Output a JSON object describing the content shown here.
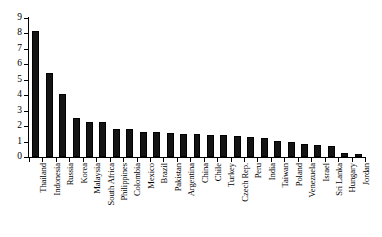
{
  "chart_data": {
    "type": "bar",
    "title": "",
    "subtitle": "",
    "xlabel": "",
    "ylabel": "",
    "ylim": [
      0,
      9
    ],
    "ytick_labels": [
      "0",
      "1",
      "2",
      "3",
      "4",
      "5",
      "6",
      "7",
      "8",
      "9"
    ],
    "ytick_values": [
      0,
      1,
      2,
      3,
      4,
      5,
      6,
      7,
      8,
      9
    ],
    "grid": false,
    "legend": null,
    "bar_color": "#141414",
    "axis_color": "#000000",
    "background_color": "#ffffff",
    "categories": [
      "Thailand",
      "Indonesia",
      "Russia",
      "Korea",
      "Malaysia",
      "South Africa",
      "Philippines",
      "Colombia",
      "Mexico",
      "Brazil",
      "Pakistan",
      "Argentina",
      "China",
      "Chile",
      "Turkey",
      "Czech Rep.",
      "Peru",
      "India",
      "Taiwan",
      "Poland",
      "Venezuela",
      "Israel",
      "Sri Lanka",
      "Hungary",
      "Jordan"
    ],
    "values": [
      8.15,
      5.45,
      4.05,
      2.55,
      2.25,
      2.25,
      1.8,
      1.8,
      1.65,
      1.6,
      1.55,
      1.5,
      1.5,
      1.45,
      1.4,
      1.35,
      1.3,
      1.2,
      1.05,
      1.0,
      0.85,
      0.75,
      0.7,
      0.25,
      0.2
    ],
    "series": [
      {
        "name": "value",
        "values": [
          8.15,
          5.45,
          4.05,
          2.55,
          2.25,
          2.25,
          1.8,
          1.8,
          1.65,
          1.6,
          1.55,
          1.5,
          1.5,
          1.45,
          1.4,
          1.35,
          1.3,
          1.2,
          1.05,
          1.0,
          0.85,
          0.75,
          0.7,
          0.25,
          0.2
        ]
      }
    ]
  }
}
